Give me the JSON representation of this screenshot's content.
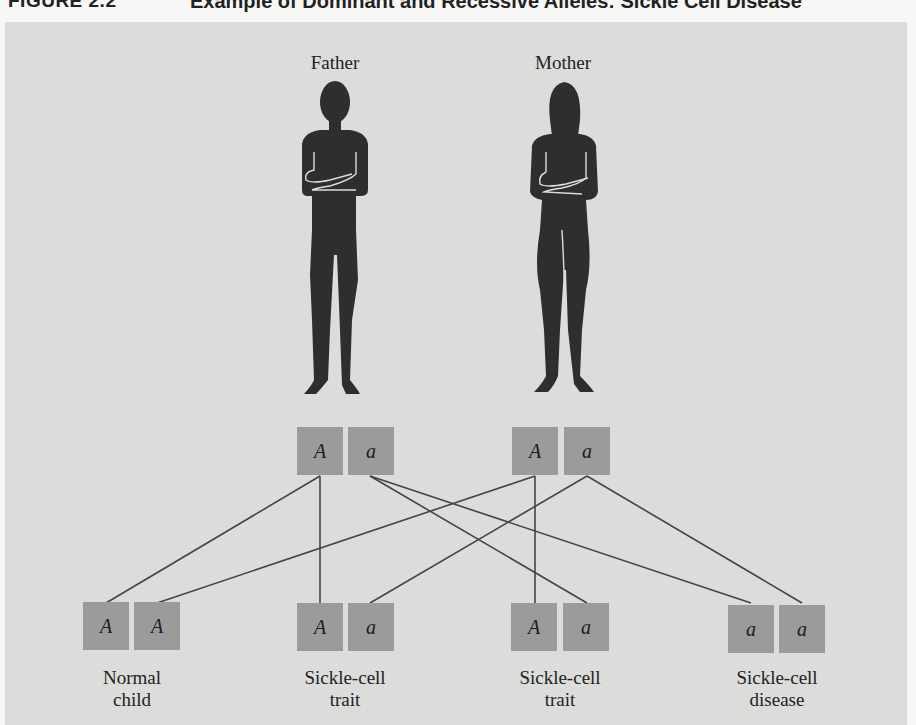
{
  "header": {
    "figure_label": "FIGURE 2.2",
    "title": "Example of Dominant and Recessive Alleles: Sickle Cell Disease"
  },
  "colors": {
    "panel": "#dcdcdb",
    "allele_box": "#9b9b9b",
    "silhouette": "#2e2e2e",
    "line": "#444444"
  },
  "parents": [
    {
      "label": "Father",
      "alleles": [
        "A",
        "a"
      ]
    },
    {
      "label": "Mother",
      "alleles": [
        "A",
        "a"
      ]
    }
  ],
  "children": [
    {
      "alleles": [
        "A",
        "A"
      ],
      "label_line1": "Normal",
      "label_line2": "child"
    },
    {
      "alleles": [
        "A",
        "a"
      ],
      "label_line1": "Sickle-cell",
      "label_line2": "trait"
    },
    {
      "alleles": [
        "A",
        "a"
      ],
      "label_line1": "Sickle-cell",
      "label_line2": "trait"
    },
    {
      "alleles": [
        "a",
        "a"
      ],
      "label_line1": "Sickle-cell",
      "label_line2": "disease"
    }
  ],
  "inheritance_links": [
    {
      "from": "father.A",
      "to": "child1.allele1"
    },
    {
      "from": "mother.A",
      "to": "child1.allele2"
    },
    {
      "from": "father.A",
      "to": "child2.allele1"
    },
    {
      "from": "mother.a",
      "to": "child2.allele2"
    },
    {
      "from": "mother.A",
      "to": "child3.allele1"
    },
    {
      "from": "father.a",
      "to": "child3.allele2"
    },
    {
      "from": "father.a",
      "to": "child4.allele1"
    },
    {
      "from": "mother.a",
      "to": "child4.allele2"
    }
  ]
}
